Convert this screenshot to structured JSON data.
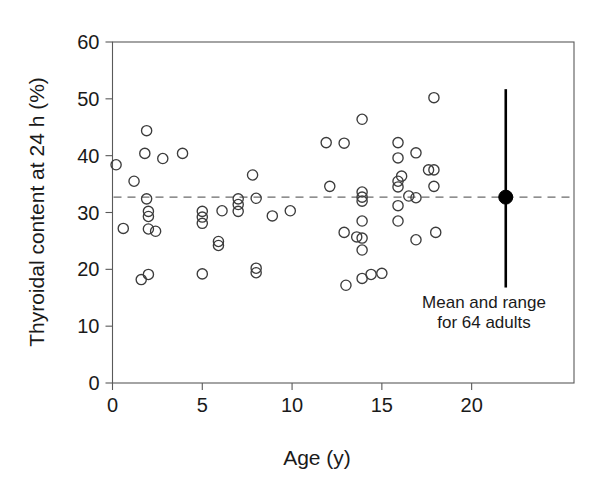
{
  "chart_data": {
    "type": "scatter",
    "title": "",
    "xlabel": "Age (y)",
    "ylabel": "Thyroidal content at 24 h (%)",
    "xlim": [
      0,
      25.7
    ],
    "ylim": [
      0,
      60
    ],
    "xticks": [
      0,
      5,
      10,
      15,
      20
    ],
    "xtick_labels": [
      "0",
      "5",
      "10",
      "15",
      "20"
    ],
    "yticks": [
      0,
      10,
      20,
      30,
      40,
      50,
      60
    ],
    "ytick_labels": [
      "0",
      "10",
      "20",
      "30",
      "40",
      "50",
      "60"
    ],
    "grid": false,
    "legend_position": "inside-lower-right",
    "marker": "open-circle",
    "reference_line": {
      "type": "horizontal-dashed",
      "value": 32.7,
      "label": "adult mean"
    },
    "series": [
      {
        "name": "Children",
        "marker": "open-circle",
        "points": [
          [
            0.2,
            38.4
          ],
          [
            0.6,
            27.2
          ],
          [
            1.2,
            35.5
          ],
          [
            1.6,
            18.2
          ],
          [
            1.8,
            40.4
          ],
          [
            1.9,
            44.4
          ],
          [
            1.9,
            32.4
          ],
          [
            2.0,
            30.2
          ],
          [
            2.0,
            29.3
          ],
          [
            2.0,
            19.1
          ],
          [
            2.0,
            27.1
          ],
          [
            2.4,
            26.7
          ],
          [
            2.8,
            39.5
          ],
          [
            3.9,
            40.4
          ],
          [
            5.0,
            30.2
          ],
          [
            5.0,
            29.2
          ],
          [
            5.0,
            28.1
          ],
          [
            5.0,
            19.2
          ],
          [
            5.9,
            24.9
          ],
          [
            5.9,
            24.2
          ],
          [
            6.1,
            30.3
          ],
          [
            7.0,
            32.4
          ],
          [
            7.0,
            31.4
          ],
          [
            7.0,
            30.2
          ],
          [
            7.8,
            36.6
          ],
          [
            8.0,
            32.5
          ],
          [
            8.0,
            20.2
          ],
          [
            8.0,
            19.4
          ],
          [
            8.9,
            29.4
          ],
          [
            9.9,
            30.3
          ],
          [
            11.9,
            42.3
          ],
          [
            12.1,
            34.6
          ],
          [
            12.9,
            42.2
          ],
          [
            12.9,
            26.5
          ],
          [
            13.0,
            17.2
          ],
          [
            13.6,
            25.7
          ],
          [
            13.9,
            46.4
          ],
          [
            13.9,
            33.6
          ],
          [
            13.9,
            32.7
          ],
          [
            13.9,
            32.0
          ],
          [
            13.9,
            28.5
          ],
          [
            13.9,
            25.5
          ],
          [
            13.9,
            23.4
          ],
          [
            13.9,
            18.4
          ],
          [
            14.4,
            19.1
          ],
          [
            15.0,
            19.3
          ],
          [
            15.9,
            42.3
          ],
          [
            15.9,
            39.6
          ],
          [
            15.9,
            35.5
          ],
          [
            15.9,
            34.5
          ],
          [
            15.9,
            31.2
          ],
          [
            15.9,
            28.5
          ],
          [
            16.1,
            36.4
          ],
          [
            16.5,
            32.9
          ],
          [
            16.9,
            40.5
          ],
          [
            16.9,
            32.6
          ],
          [
            16.9,
            25.2
          ],
          [
            17.6,
            37.5
          ],
          [
            17.9,
            37.5
          ],
          [
            17.9,
            50.2
          ],
          [
            17.9,
            34.6
          ],
          [
            18.0,
            26.5
          ]
        ]
      }
    ],
    "summary_marker": {
      "name": "Mean and range for 64 adults",
      "x": 21.9,
      "mean": 32.7,
      "range_low": 16.8,
      "range_high": 51.7,
      "marker": "filled-circle",
      "label_line_1": "Mean and range",
      "label_line_2": "for 64 adults"
    }
  },
  "colors": {
    "axis": "#595959",
    "marker_stroke": "#3c3c3c",
    "text": "#1a1a1a",
    "reference_line": "#6b6b6b",
    "summary": "#000000",
    "background": "#ffffff"
  }
}
